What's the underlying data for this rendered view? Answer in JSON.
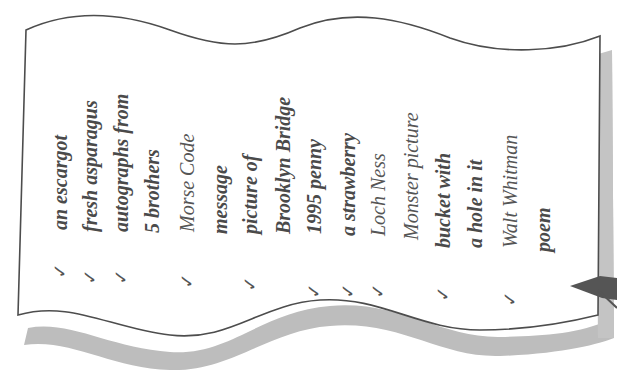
{
  "list": {
    "items": [
      {
        "text": "an escargot",
        "x": 50,
        "y": 230,
        "checked": true,
        "check_y": 262
      },
      {
        "text": "fresh asparagus",
        "x": 80,
        "y": 232,
        "checked": true,
        "check_y": 268
      },
      {
        "text": "autographs from",
        "x": 111,
        "y": 232,
        "checked": true,
        "check_y": 268
      },
      {
        "text": "5 brothers",
        "x": 142,
        "y": 233,
        "checked": false
      },
      {
        "text": "Morse Code",
        "x": 177,
        "y": 232,
        "checked": true,
        "check_y": 272
      },
      {
        "text": "message",
        "x": 210,
        "y": 234,
        "checked": false
      },
      {
        "text": "picture of",
        "x": 240,
        "y": 234,
        "checked": true,
        "check_y": 275
      },
      {
        "text": "Brooklyn Bridge",
        "x": 273,
        "y": 234,
        "checked": false
      },
      {
        "text": "1995 penny",
        "x": 304,
        "y": 234,
        "checked": true,
        "check_y": 282
      },
      {
        "text": "a strawberry",
        "x": 338,
        "y": 236,
        "checked": true,
        "check_y": 282
      },
      {
        "text": "Loch Ness",
        "x": 368,
        "y": 236,
        "checked": true,
        "check_y": 282
      },
      {
        "text": "Monster picture",
        "x": 401,
        "y": 240,
        "checked": false
      },
      {
        "text": "bucket with",
        "x": 433,
        "y": 248,
        "checked": true,
        "check_y": 285
      },
      {
        "text": "a hole in it",
        "x": 465,
        "y": 248,
        "checked": false
      },
      {
        "text": "Walt Whitman",
        "x": 500,
        "y": 248,
        "checked": true,
        "check_y": 290
      },
      {
        "text": "poem",
        "x": 533,
        "y": 252,
        "checked": false
      }
    ],
    "check_glyph": "✓"
  },
  "decor": {
    "paper_color": "#ffffff",
    "outline_color": "#4d4d4d",
    "shadow_color": "#bdbdbd",
    "arrow_color": "#555555",
    "arrow_icon": "arrow-pointer-icon"
  }
}
